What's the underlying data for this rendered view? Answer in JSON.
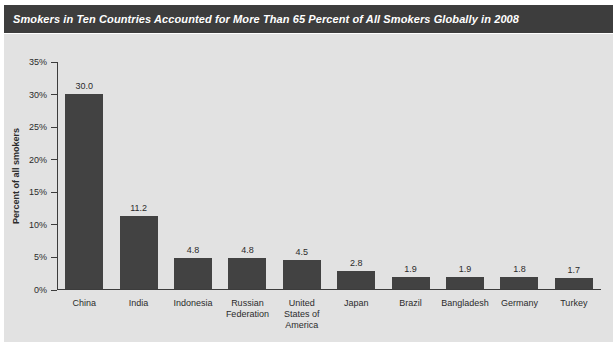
{
  "chart_data": {
    "type": "bar",
    "title": "Smokers in Ten Countries Accounted for More Than 65 Percent of All Smokers Globally in 2008",
    "categories": [
      "China",
      "India",
      "Indonesia",
      "Russian\nFederation",
      "United\nStates of\nAmerica",
      "Japan",
      "Brazil",
      "Bangladesh",
      "Germany",
      "Turkey"
    ],
    "values": [
      30.0,
      11.2,
      4.8,
      4.8,
      4.5,
      2.8,
      1.9,
      1.9,
      1.8,
      1.7
    ],
    "value_labels": [
      "30.0",
      "11.2",
      "4.8",
      "4.8",
      "4.5",
      "2.8",
      "1.9",
      "1.9",
      "1.8",
      "1.7"
    ],
    "xlabel": "",
    "ylabel": "Percent of all smokers",
    "ylim": [
      0,
      35
    ],
    "ytick_step": 5,
    "ytick_labels": [
      "0%",
      "5%",
      "10%",
      "15%",
      "20%",
      "25%",
      "30%",
      "35%"
    ],
    "grid": false,
    "legend": "none",
    "colors": {
      "bar": "#424242",
      "title_bar_bg": "#3d3d3d",
      "title_text": "#ffffff",
      "panel_bg": "#e2e2e2",
      "axis": "#3c3c3c",
      "text": "#2b2b2b"
    }
  }
}
